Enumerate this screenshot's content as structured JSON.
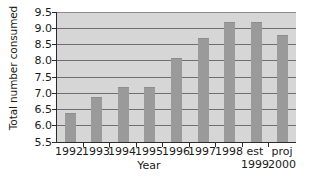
{
  "chart_data": {
    "type": "bar",
    "title": "",
    "xlabel": "Year",
    "ylabel": "Total number consumed",
    "categories": [
      "1992",
      "1993",
      "1994",
      "1995",
      "1996",
      "1997",
      "1998",
      "est 1999",
      "proj 2000"
    ],
    "category_labels": [
      {
        "line1": "1992",
        "line2": ""
      },
      {
        "line1": "1993",
        "line2": ""
      },
      {
        "line1": "1994",
        "line2": ""
      },
      {
        "line1": "1995",
        "line2": ""
      },
      {
        "line1": "1996",
        "line2": ""
      },
      {
        "line1": "1997",
        "line2": ""
      },
      {
        "line1": "1998",
        "line2": ""
      },
      {
        "line1": "est",
        "line2": "1999"
      },
      {
        "line1": "proj",
        "line2": "2000"
      }
    ],
    "values": [
      6.4,
      6.9,
      7.2,
      7.2,
      8.1,
      8.7,
      9.2,
      9.2,
      8.8
    ],
    "ylim": [
      5.5,
      9.5
    ],
    "yticks": [
      5.5,
      6.0,
      6.5,
      7.0,
      7.5,
      8.0,
      8.5,
      9.0,
      9.5
    ],
    "ytick_labels": [
      "5.5",
      "6.0",
      "6.5",
      "7.0",
      "7.5",
      "8.0",
      "8.5",
      "9.0",
      "9.5"
    ],
    "grid": true,
    "legend": null,
    "colors": {
      "bar": "#9a9a9a",
      "plot_background": "#d6d6d6",
      "gridline": "#6f6f6f",
      "axis": "#2b2b2b",
      "text": "#1a1a1a",
      "page_background": "#ffffff"
    }
  }
}
